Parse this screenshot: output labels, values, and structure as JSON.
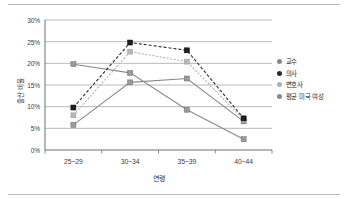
{
  "chart_data": {
    "type": "line",
    "title": "",
    "subtitle": "",
    "xlabel": "연령",
    "ylabel": "출산 비율",
    "categories": [
      "25~29",
      "30~34",
      "35~39",
      "40~44"
    ],
    "ylim": [
      0,
      30
    ],
    "ytick_labels": [
      "0%",
      "5%",
      "10%",
      "15%",
      "20%",
      "25%",
      "30%"
    ],
    "ytick_values": [
      0,
      5,
      10,
      15,
      20,
      25,
      30
    ],
    "grid": "horizontal",
    "legend_position": "right",
    "series": [
      {
        "name": "교수",
        "values": [
          5.8,
          15.6,
          16.5,
          6.6
        ],
        "color": "#8a8a8a",
        "line_style": "solid",
        "marker": "square"
      },
      {
        "name": "의사",
        "values": [
          9.8,
          24.8,
          23.0,
          7.3
        ],
        "color": "#2b2b2b",
        "line_style": "dashed",
        "marker": "square"
      },
      {
        "name": "변호사",
        "values": [
          8.0,
          22.7,
          20.4,
          7.0
        ],
        "color": "#b0b0b0",
        "line_style": "dotted",
        "marker": "square"
      },
      {
        "name": "평균 미국 여성",
        "values": [
          19.8,
          17.8,
          9.3,
          2.5
        ],
        "color": "#8a8a8a",
        "line_style": "solid",
        "marker": "square"
      }
    ]
  },
  "legend": {
    "items": [
      {
        "label": "교수",
        "color": "#8a8a8a"
      },
      {
        "label": "의사",
        "color": "#2b2b2b"
      },
      {
        "label": "변호사",
        "color": "#b0b0b0"
      },
      {
        "label": "평균 미국 여성",
        "color": "#8a8a8a"
      }
    ]
  },
  "axes": {
    "y_title": "출산 비율",
    "x_title": "연령",
    "y_ticks": [
      "30%",
      "25%",
      "20%",
      "15%",
      "10%",
      "5%",
      "0%"
    ],
    "x_ticks": [
      "25~29",
      "30~34",
      "35~39",
      "40~44"
    ]
  }
}
